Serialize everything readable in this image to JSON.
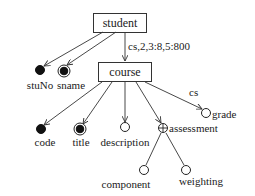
{
  "diagram": {
    "type": "ORA-SS schema tree",
    "colors": {
      "stroke": "#333333",
      "text": "#1a1a1a",
      "fill": "#111111",
      "background": "#ffffff"
    },
    "objects": [
      {
        "id": "student",
        "label": "student"
      },
      {
        "id": "course",
        "label": "course"
      }
    ],
    "relationships": [
      {
        "from": "student",
        "to": "course",
        "label": "cs,2,3:8,5:800"
      },
      {
        "from": "course",
        "to": "grade",
        "label": "cs"
      }
    ],
    "attributes": [
      {
        "id": "stuNo",
        "label": "stuNo",
        "parent": "student",
        "kind": "key-filled"
      },
      {
        "id": "sname",
        "label": "sname",
        "parent": "student",
        "kind": "double-open"
      },
      {
        "id": "code",
        "label": "code",
        "parent": "course",
        "kind": "key-filled"
      },
      {
        "id": "title",
        "label": "title",
        "parent": "course",
        "kind": "double-filled"
      },
      {
        "id": "description",
        "label": "description",
        "parent": "course",
        "kind": "open"
      },
      {
        "id": "assessment",
        "label": "assessment",
        "parent": "course",
        "kind": "composite-plus"
      },
      {
        "id": "grade",
        "label": "grade",
        "parent": "course",
        "kind": "open"
      },
      {
        "id": "component",
        "label": "component",
        "parent": "assessment",
        "kind": "open"
      },
      {
        "id": "weighting",
        "label": "weighting",
        "parent": "assessment",
        "kind": "open"
      }
    ]
  }
}
